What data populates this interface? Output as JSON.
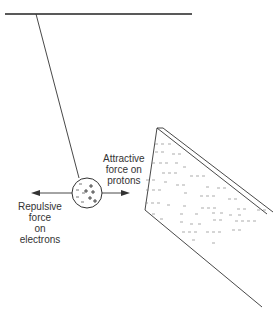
{
  "diagram": {
    "ceiling": {
      "x1": 5,
      "y1": 14,
      "x2": 192,
      "y2": 14
    },
    "string": {
      "x1": 36,
      "y1": 14,
      "x2": 79,
      "y2": 178
    },
    "ball": {
      "cx": 87,
      "cy": 193,
      "r": 15,
      "negative_signs": 5,
      "positive_signs": 4
    },
    "rod": {
      "label": "charged rod (negative)"
    },
    "labels": {
      "attractive_line1": "Attractive",
      "attractive_line2": "force on",
      "attractive_line3": "protons",
      "repulsive_line1": "Repulsive",
      "repulsive_line2": "force",
      "repulsive_line3": "on",
      "repulsive_line4": "electrons"
    },
    "colors": {
      "stroke": "#333333",
      "dash": "#888888",
      "background": "#ffffff"
    }
  }
}
